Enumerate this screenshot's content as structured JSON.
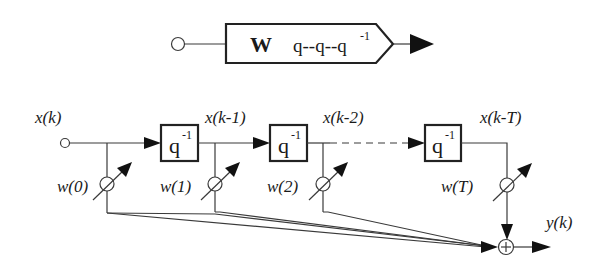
{
  "compact_symbol": {
    "weight_label": "W",
    "operator_label": "q--q--q",
    "operator_superscript": "-1"
  },
  "tapped_delay_line": {
    "input_label": "x(k)",
    "output_label": "y(k)",
    "delay_blocks": [
      {
        "label": "q",
        "superscript": "-1",
        "output_label": "x(k-1)"
      },
      {
        "label": "q",
        "superscript": "-1",
        "output_label": "x(k-2)"
      },
      {
        "label": "q",
        "superscript": "-1",
        "output_label": "x(k-T)"
      }
    ],
    "weights": [
      {
        "label": "w(0)"
      },
      {
        "label": "w(1)"
      },
      {
        "label": "w(2)"
      },
      {
        "label": "w(T)"
      }
    ],
    "summation_symbol": "+"
  }
}
